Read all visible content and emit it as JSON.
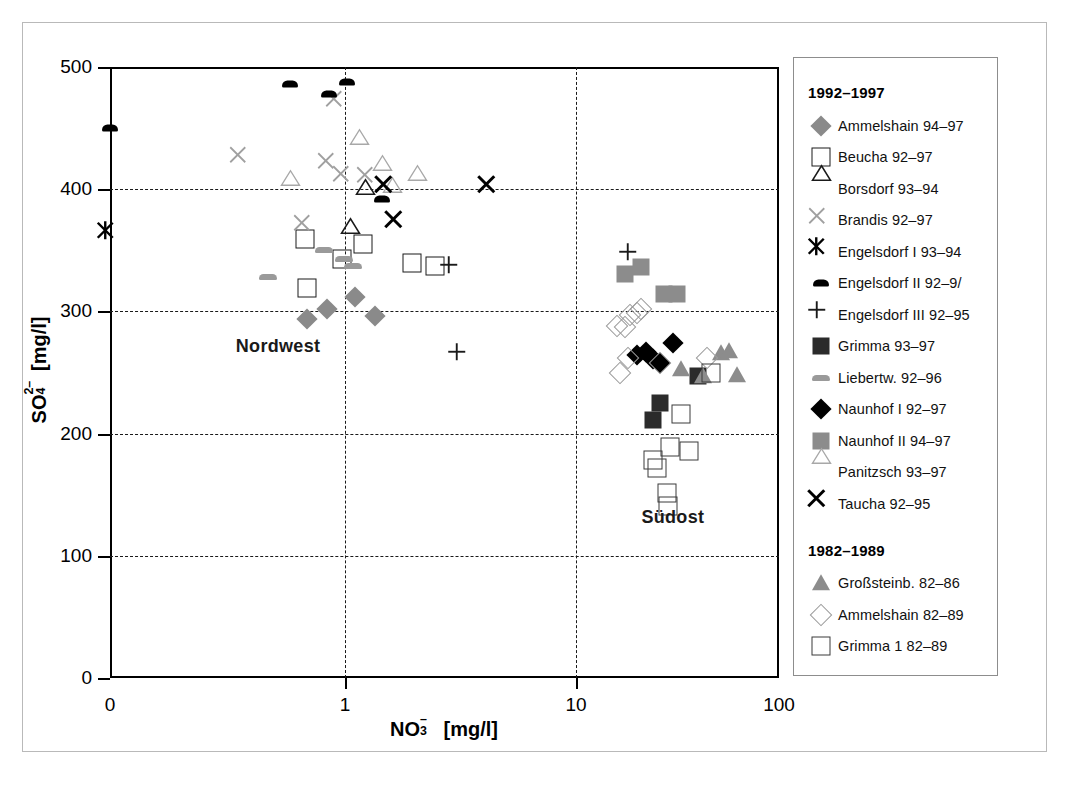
{
  "axes": {
    "y_title_main": "SO",
    "y_title_sub": "4",
    "y_title_sup": "2–",
    "y_title_unit": "[mg/l]",
    "y_title_full": "SO4 2- [mg/l]",
    "x_title_main": "NO",
    "x_title_sub": "3",
    "x_title_sup": "–",
    "x_title_unit": "[mg/l]",
    "x_title_full": "NO3- [mg/l]",
    "y_ticks": [
      "0",
      "100",
      "200",
      "300",
      "400",
      "500"
    ],
    "x_ticks": [
      "0",
      "1",
      "10",
      "100"
    ],
    "y_min": 0,
    "y_max": 500,
    "x_scale": "log-with-zero-break",
    "grid": true
  },
  "annotations": {
    "nordwest": "Nordwest",
    "suedost": "Südost"
  },
  "legend": {
    "group1_title": "1992–1997",
    "group2_title": "1982–1989",
    "group1": [
      {
        "label": "Ammelshain 94–97",
        "symbol": "diamond-gray"
      },
      {
        "label": "Beucha 92–97",
        "symbol": "square-open"
      },
      {
        "label": "Borsdorf 93–94",
        "symbol": "triangle-open-dark"
      },
      {
        "label": "Brandis  92–97",
        "symbol": "x-gray"
      },
      {
        "label": "Engelsdorf I 93–94",
        "symbol": "asterisk-black"
      },
      {
        "label": "Engelsdorf II 92–9/",
        "symbol": "bar-black"
      },
      {
        "label": "Engelsdorf III 92–95",
        "symbol": "plus-black"
      },
      {
        "label": "Grimma 93–97",
        "symbol": "square-dark"
      },
      {
        "label": "Liebertw. 92–96",
        "symbol": "bar-gray"
      },
      {
        "label": "Naunhof I 92–97",
        "symbol": "diamond-black"
      },
      {
        "label": "Naunhof II 94–97",
        "symbol": "square-gray"
      },
      {
        "label": "Panitzsch 93–97",
        "symbol": "triangle-open-light"
      },
      {
        "label": "Taucha 92–95",
        "symbol": "x-black"
      }
    ],
    "group2": [
      {
        "label": "Großsteinb. 82–86",
        "symbol": "triangle-gray"
      },
      {
        "label": "Ammelshain 82–89",
        "symbol": "diamond-open"
      },
      {
        "label": "Grimma 1 82–89",
        "symbol": "square-open-lt"
      }
    ]
  },
  "chart_data": {
    "type": "scatter",
    "title": "",
    "xlabel": "NO3- [mg/l]",
    "ylabel": "SO4 2- [mg/l]",
    "xlim": [
      0,
      100
    ],
    "ylim": [
      0,
      500
    ],
    "xscale": "log (0 plotted at axis origin)",
    "grid": true,
    "legend_position": "right",
    "annotations": [
      {
        "text": "Nordwest",
        "x": 0.35,
        "y": 272
      },
      {
        "text": "Südost",
        "x": 30,
        "y": 132
      }
    ],
    "series": [
      {
        "name": "Ammelshain 94–97",
        "symbol": "diamond-gray",
        "points": [
          [
            0.55,
            294
          ],
          [
            0.76,
            302
          ],
          [
            1.1,
            312
          ],
          [
            1.35,
            296
          ]
        ]
      },
      {
        "name": "Beucha 92–97",
        "symbol": "square-open",
        "points": [
          [
            0.53,
            359
          ],
          [
            0.55,
            319
          ],
          [
            0.96,
            343
          ],
          [
            1.2,
            355
          ],
          [
            1.95,
            340
          ],
          [
            2.45,
            337
          ]
        ]
      },
      {
        "name": "Borsdorf 93–94",
        "symbol": "triangle-open-dark",
        "points": [
          [
            1.05,
            357
          ],
          [
            1.22,
            389
          ]
        ]
      },
      {
        "name": "Brandis 92–97",
        "symbol": "x-gray",
        "points": [
          [
            0.2,
            424
          ],
          [
            0.55,
            369
          ],
          [
            0.8,
            419
          ],
          [
            0.9,
            470
          ],
          [
            1.0,
            409
          ],
          [
            1.28,
            408
          ]
        ]
      },
      {
        "name": "Engelsdorf I 93–94",
        "symbol": "asterisk-black",
        "points": [
          [
            0.0,
            362
          ]
        ]
      },
      {
        "name": "Engelsdorf II 92–9/",
        "symbol": "bar-black",
        "points": [
          [
            0.0,
            450
          ],
          [
            0.42,
            486
          ],
          [
            0.78,
            478
          ],
          [
            1.02,
            488
          ],
          [
            1.45,
            392
          ]
        ]
      },
      {
        "name": "Engelsdorf III 92–95",
        "symbol": "plus-black",
        "points": [
          [
            2.95,
            334
          ],
          [
            3.2,
            263
          ],
          [
            19,
            345
          ]
        ]
      },
      {
        "name": "Grimma 93–97",
        "symbol": "square-dark",
        "points": [
          [
            26,
            225
          ],
          [
            24,
            211
          ],
          [
            40,
            247
          ]
        ]
      },
      {
        "name": "Liebertw. 92–96",
        "symbol": "bar-gray",
        "points": [
          [
            0.3,
            328
          ],
          [
            0.72,
            350
          ],
          [
            0.98,
            343
          ],
          [
            1.08,
            337
          ]
        ]
      },
      {
        "name": "Naunhof I 92–97",
        "symbol": "diamond-black",
        "points": [
          [
            20,
            264
          ],
          [
            22,
            267
          ],
          [
            24,
            261
          ],
          [
            26,
            258
          ],
          [
            30,
            274
          ]
        ]
      },
      {
        "name": "Naunhof II 94–97",
        "symbol": "square-gray",
        "points": [
          [
            17.5,
            331
          ],
          [
            21,
            336
          ],
          [
            27,
            314
          ],
          [
            31.5,
            314
          ]
        ]
      },
      {
        "name": "Panitzsch 93–97",
        "symbol": "triangle-open-light",
        "points": [
          [
            0.42,
            396
          ],
          [
            1.15,
            430
          ],
          [
            1.45,
            408
          ],
          [
            1.6,
            390
          ],
          [
            2.05,
            400
          ]
        ]
      },
      {
        "name": "Taucha 92–95",
        "symbol": "x-black",
        "points": [
          [
            1.55,
            400
          ],
          [
            1.7,
            371
          ],
          [
            4.3,
            400
          ]
        ]
      },
      {
        "name": "Großsteinb. 82–86",
        "symbol": "triangle-gray",
        "points": [
          [
            33,
            253
          ],
          [
            42,
            247
          ],
          [
            52,
            266
          ],
          [
            57,
            268
          ],
          [
            62,
            248
          ]
        ]
      },
      {
        "name": "Ammelshain 82–89",
        "symbol": "diamond-open",
        "points": [
          [
            16,
            288
          ],
          [
            17.5,
            287
          ],
          [
            18.5,
            297
          ],
          [
            20,
            299
          ],
          [
            21,
            302
          ],
          [
            16.5,
            250
          ],
          [
            18,
            262
          ],
          [
            26,
            258
          ],
          [
            44,
            262
          ]
        ]
      },
      {
        "name": "Grimma 1 82–89",
        "symbol": "square-open-lt",
        "points": [
          [
            24,
            178
          ],
          [
            25,
            172
          ],
          [
            29,
            189
          ],
          [
            36,
            186
          ],
          [
            28,
            151
          ],
          [
            28.5,
            141
          ],
          [
            46,
            250
          ],
          [
            33,
            216
          ]
        ]
      }
    ]
  }
}
